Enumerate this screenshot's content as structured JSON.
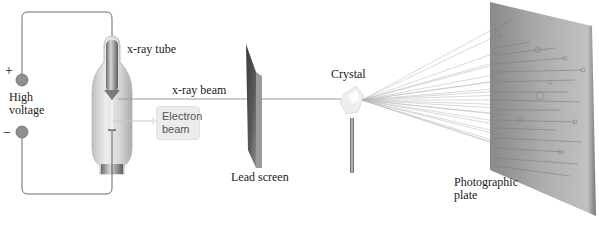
{
  "figure": {
    "labels": {
      "xray_tube": "x-ray tube",
      "high_voltage_line1": "High",
      "high_voltage_line2": "voltage",
      "plus": "+",
      "minus": "−",
      "xray_beam": "x-ray beam",
      "electron_beam_line1": "Electron",
      "electron_beam_line2": "beam",
      "lead_screen": "Lead screen",
      "crystal": "Crystal",
      "photographic_plate_line1": "Photographic",
      "photographic_plate_line2": "plate"
    },
    "colors": {
      "wire": "#6a6a6a",
      "terminal": "#8f8f8f",
      "glass": "#d9d9d9",
      "lead": "#4a4a4a",
      "plate": "#9a9a9a",
      "beam": "#9c9c9c",
      "callout_bg": "#ececec"
    }
  }
}
